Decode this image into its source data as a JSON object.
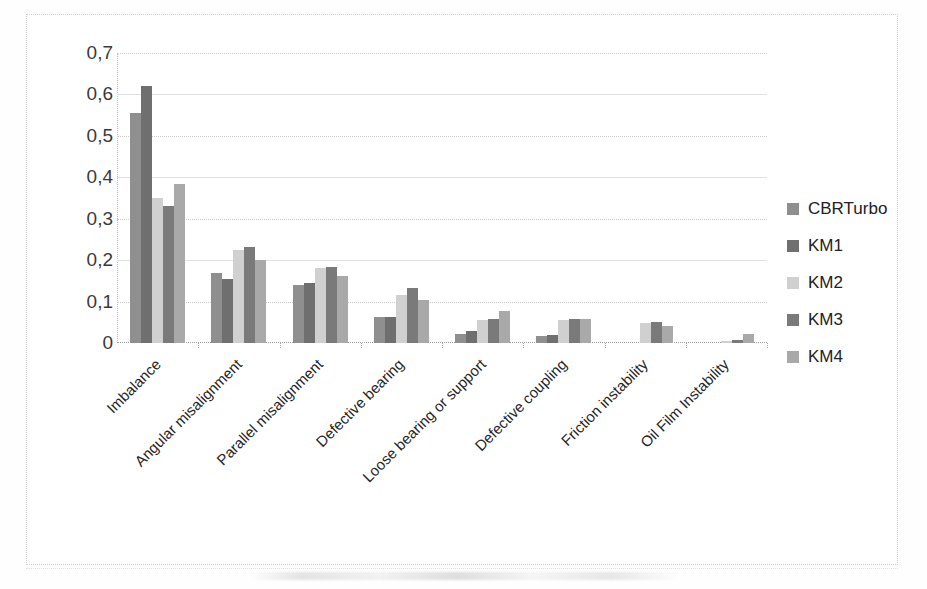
{
  "chart_data": {
    "type": "bar",
    "title": "",
    "xlabel": "",
    "ylabel": "",
    "ylim": [
      0,
      0.7
    ],
    "ytick_labels": [
      "0,7",
      "0,6",
      "0,5",
      "0,4",
      "0,3",
      "0,2",
      "0,1",
      "0"
    ],
    "ytick_values": [
      0.7,
      0.6,
      0.5,
      0.4,
      0.3,
      0.2,
      0.1,
      0
    ],
    "grid": true,
    "legend_position": "right",
    "decimal_separator": ",",
    "categories": [
      "Imbalance",
      "Angular misalignment",
      "Parallel misalignment",
      "Defective bearing",
      "Loose bearing or support",
      "Defective coupling",
      "Friction instability",
      "Oil Film Instability"
    ],
    "series": [
      {
        "name": "CBRTurbo",
        "color": "#8f8f8f",
        "values": [
          0.555,
          0.168,
          0.14,
          0.062,
          0.022,
          0.016,
          0.0,
          0.0
        ]
      },
      {
        "name": "KM1",
        "color": "#6f6f6f",
        "values": [
          0.62,
          0.155,
          0.145,
          0.062,
          0.03,
          0.02,
          0.0,
          0.0
        ]
      },
      {
        "name": "KM2",
        "color": "#d0d0d0",
        "values": [
          0.35,
          0.225,
          0.182,
          0.115,
          0.055,
          0.055,
          0.048,
          0.005
        ]
      },
      {
        "name": "KM3",
        "color": "#7a7a7a",
        "values": [
          0.33,
          0.232,
          0.183,
          0.132,
          0.058,
          0.058,
          0.05,
          0.008
        ]
      },
      {
        "name": "KM4",
        "color": "#a9a9a9",
        "values": [
          0.385,
          0.2,
          0.162,
          0.105,
          0.078,
          0.058,
          0.04,
          0.021
        ]
      }
    ]
  },
  "legend": {
    "items": [
      {
        "label": "CBRTurbo"
      },
      {
        "label": "KM1"
      },
      {
        "label": "KM2"
      },
      {
        "label": "KM3"
      },
      {
        "label": "KM4"
      }
    ]
  }
}
